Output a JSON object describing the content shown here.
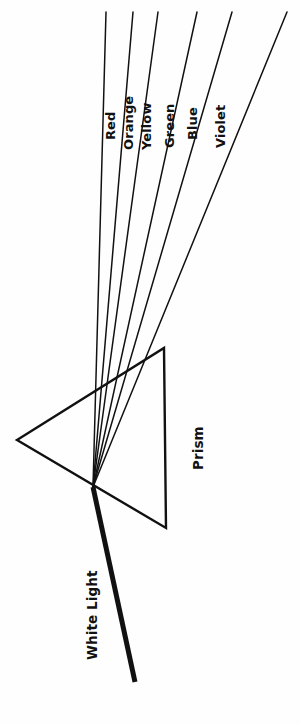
{
  "figure": {
    "background_color": "#fefefe",
    "ink_color": "#111111",
    "width": 300,
    "height": 725
  },
  "prism": {
    "label": "Prism",
    "label_rotation_deg": -90,
    "vertices": [
      {
        "name": "left-vertex",
        "x": 17,
        "y": 440
      },
      {
        "name": "top-right-vertex",
        "x": 164,
        "y": 348
      },
      {
        "name": "bottom-right-vertex",
        "x": 166,
        "y": 528
      }
    ],
    "stroke_width": 2.4
  },
  "incident_beam": {
    "label": "White Light",
    "label_rotation_deg": -90,
    "stroke_width": 5,
    "start": {
      "x": 135,
      "y": 682
    },
    "end": {
      "x": 93,
      "y": 487
    }
  },
  "refraction_point": {
    "x": 93,
    "y": 487
  },
  "dispersed_rays": [
    {
      "label": "Red",
      "top_x": 106,
      "top_y": 12,
      "stroke_width": 1.5,
      "label_x": 104,
      "label_y": 140
    },
    {
      "label": "Orange",
      "top_x": 133,
      "top_y": 12,
      "stroke_width": 1.5,
      "label_x": 122,
      "label_y": 150
    },
    {
      "label": "Yellow",
      "top_x": 158,
      "top_y": 12,
      "stroke_width": 1.5,
      "label_x": 140,
      "label_y": 150
    },
    {
      "label": "Green",
      "top_x": 197,
      "top_y": 12,
      "stroke_width": 1.5,
      "label_x": 163,
      "label_y": 148
    },
    {
      "label": "Blue",
      "top_x": 232,
      "top_y": 12,
      "stroke_width": 1.5,
      "label_x": 186,
      "label_y": 140
    },
    {
      "label": "Violet",
      "top_x": 287,
      "top_y": 12,
      "stroke_width": 1.5,
      "label_x": 214,
      "label_y": 148
    }
  ],
  "labels": {
    "prism_x": 192,
    "prism_y": 470,
    "white_light_x": 86,
    "white_light_y": 660
  }
}
